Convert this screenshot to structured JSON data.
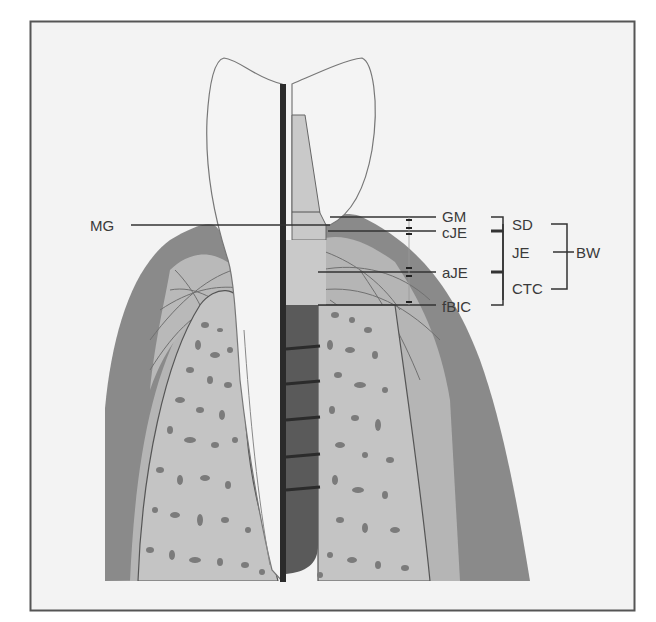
{
  "figure": {
    "kind": "schematic cross-section: natural tooth (left) vs. dental implant (right) with peri-implant soft tissue",
    "colors": {
      "background": "#f3f3f3",
      "frame": "#555555",
      "gingiva_outer": "#8a8a8a",
      "connective_tissue": "#b5b5b5",
      "bone": "#c4c4c4",
      "bone_pores": "#7b7b7b",
      "crown": "#f4f4f4",
      "implant_body": "#5a5a5a",
      "abutment": "#c9c9c9",
      "divider": "#2b2b2b",
      "label_text": "#3a3a3a"
    }
  },
  "labels": {
    "left": {
      "mg": "MG"
    },
    "levels": [
      {
        "id": "gm",
        "text": "GM"
      },
      {
        "id": "cje",
        "text": "cJE"
      },
      {
        "id": "aje",
        "text": "aJE"
      },
      {
        "id": "fbic",
        "text": "fBIC"
      }
    ],
    "brackets": [
      {
        "id": "sd",
        "text": "SD"
      },
      {
        "id": "je",
        "text": "JE"
      },
      {
        "id": "ctc",
        "text": "CTC"
      }
    ],
    "outer_bracket": {
      "id": "bw",
      "text": "BW"
    }
  }
}
